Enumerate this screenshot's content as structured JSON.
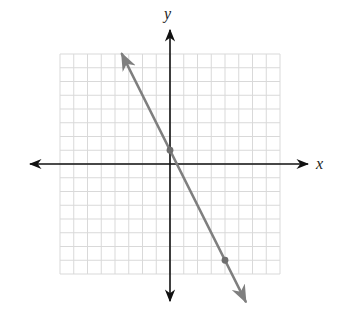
{
  "chart_data": {
    "type": "line",
    "title": "",
    "xlabel": "x",
    "ylabel": "y",
    "xlim": [
      -8,
      8
    ],
    "ylim": [
      -8,
      8
    ],
    "grid": true,
    "grid_step": 1,
    "tick_labels": false,
    "series": [
      {
        "name": "line",
        "equation": "y = -2x + 1",
        "slope": -2,
        "intercept": 1,
        "x": [
          -3.5,
          5.5
        ],
        "y": [
          8,
          -10
        ],
        "color": "#7f7f7f",
        "arrows": true
      }
    ],
    "points": [
      {
        "x": 0,
        "y": 1
      },
      {
        "x": 4,
        "y": -7
      }
    ]
  },
  "labels": {
    "x_axis": "x",
    "y_axis": "y"
  },
  "colors": {
    "grid": "#d9d9d9",
    "axis": "#111111",
    "line": "#7f7f7f",
    "point": "#6e6e6e"
  }
}
